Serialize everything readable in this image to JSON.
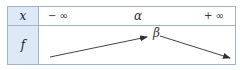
{
  "variation_table": {
    "row_labels": {
      "x": "x",
      "f": "f"
    },
    "x_values": {
      "left": "− ∞",
      "middle": "α",
      "right": "+ ∞"
    },
    "f_values": {
      "peak": "β"
    },
    "arrows": [
      {
        "direction": "increasing",
        "from": "− ∞",
        "to": "α"
      },
      {
        "direction": "decreasing",
        "from": "α",
        "to": "+ ∞"
      }
    ],
    "colors": {
      "header_bg": "#dde9f6",
      "border": "#9fb4c7",
      "text": "#333333"
    }
  }
}
